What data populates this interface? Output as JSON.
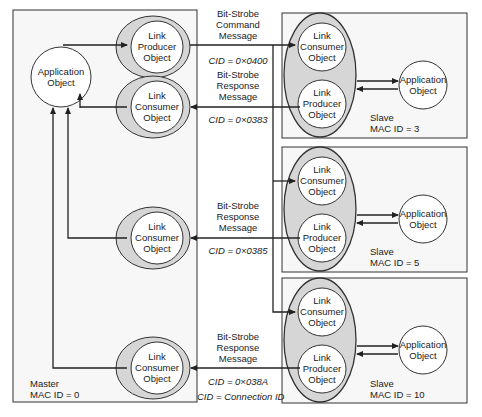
{
  "master": {
    "label": "Master",
    "mac": "MAC ID = 0",
    "app": [
      "Application",
      "Object"
    ],
    "producer": [
      "Link",
      "Producer",
      "Object"
    ],
    "consumers": [
      [
        "Link",
        "Consumer",
        "Object"
      ],
      [
        "Link",
        "Consumer",
        "Object"
      ],
      [
        "Link",
        "Consumer",
        "Object"
      ]
    ]
  },
  "messages": [
    {
      "lines": [
        "Bit-Strobe",
        "Command",
        "Message"
      ],
      "cid": "CID = 0×0400"
    },
    {
      "lines": [
        "Bit-Strobe",
        "Response",
        "Message"
      ],
      "cid": "CID = 0×0383"
    },
    {
      "lines": [
        "Bit-Strobe",
        "Response",
        "Message"
      ],
      "cid": "CID = 0×0385"
    },
    {
      "lines": [
        "Bit-Strobe",
        "Response",
        "Message"
      ],
      "cid": "CID = 0×038A"
    }
  ],
  "legend": "CID = Connection ID",
  "slaves": [
    {
      "label": "Slave",
      "mac": "MAC ID = 3",
      "consumer": [
        "Link",
        "Consumer",
        "Object"
      ],
      "producer": [
        "Link",
        "Producer",
        "Object"
      ],
      "app": [
        "Application",
        "Object"
      ]
    },
    {
      "label": "Slave",
      "mac": "MAC ID = 5",
      "consumer": [
        "Link",
        "Consumer",
        "Object"
      ],
      "producer": [
        "Link",
        "Producer",
        "Object"
      ],
      "app": [
        "Application",
        "Object"
      ]
    },
    {
      "label": "Slave",
      "mac": "MAC ID = 10",
      "consumer": [
        "Link",
        "Consumer",
        "Object"
      ],
      "producer": [
        "Link",
        "Producer",
        "Object"
      ],
      "app": [
        "Application",
        "Object"
      ]
    }
  ],
  "colors": {
    "box_fill": "#f7f7f7",
    "ellipse_fill": "#d6d6d6",
    "line": "#222222"
  }
}
